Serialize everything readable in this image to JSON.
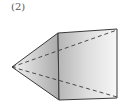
{
  "figure": {
    "label": "(2)",
    "colors": {
      "edge": "#3a3a3a",
      "fill_dark": "#a8a8a8",
      "fill_light": "#f2f2f2"
    }
  }
}
